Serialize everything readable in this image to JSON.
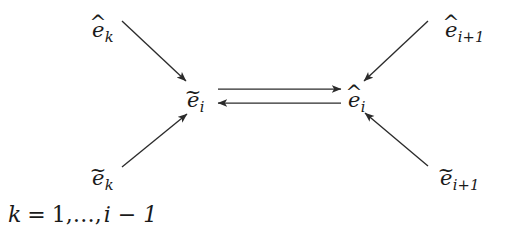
{
  "figure": {
    "type": "diagram",
    "background_color": "#ffffff",
    "stroke_color": "#2b2b2b",
    "text_color": "#1a1a1a"
  },
  "nodes": {
    "center_left": {
      "id": "e-tilde-i",
      "base": "e",
      "accent": "~",
      "subscript": "i",
      "text": "ẽi",
      "x": 193,
      "y": 95
    },
    "center_right": {
      "id": "e-hat-i",
      "base": "e",
      "accent": "^",
      "subscript": "i",
      "text": "êi",
      "x": 355,
      "y": 95
    }
  },
  "peripheral": {
    "top_left": {
      "id": "e-hat-k",
      "base": "e",
      "accent": "^",
      "subscript": "k",
      "text": "êk",
      "x": 92,
      "y": 20
    },
    "bottom_left": {
      "id": "e-tilde-k",
      "base": "e",
      "accent": "~",
      "subscript": "k",
      "text": "ẽk",
      "x": 92,
      "y": 168
    },
    "top_right": {
      "id": "e-hat-i-plus-1",
      "base": "e",
      "accent": "^",
      "subscript": "i+1",
      "text": "êi+1",
      "x": 445,
      "y": 20
    },
    "bottom_right": {
      "id": "e-tilde-i-plus-1",
      "base": "e",
      "accent": "~",
      "subscript": "i+1",
      "text": "ẽi+1",
      "x": 440,
      "y": 168
    }
  },
  "edges": [
    {
      "id": "arrow-hat-k-to-tilde-i",
      "from": "e-hat-k",
      "to": "e-tilde-i",
      "direction": "down-right",
      "x1": 122,
      "y1": 21,
      "x2": 186,
      "y2": 81
    },
    {
      "id": "arrow-tilde-k-to-tilde-i",
      "from": "e-tilde-k",
      "to": "e-tilde-i",
      "direction": "up-right",
      "x1": 122,
      "y1": 167,
      "x2": 187,
      "y2": 114
    },
    {
      "id": "arrow-hat-i1-to-hat-i",
      "from": "e-hat-i-plus-1",
      "to": "e-hat-i",
      "direction": "down-left",
      "x1": 428,
      "y1": 21,
      "x2": 364,
      "y2": 81
    },
    {
      "id": "arrow-tilde-i1-to-hat-i",
      "from": "e-tilde-i-plus-1",
      "to": "e-hat-i",
      "direction": "up-left",
      "x1": 428,
      "y1": 166,
      "x2": 365,
      "y2": 113
    },
    {
      "id": "arrow-tilde-i-to-hat-i",
      "from": "e-tilde-i",
      "to": "e-hat-i",
      "direction": "right",
      "x1": 218,
      "y1": 89,
      "x2": 340,
      "y2": 89
    },
    {
      "id": "arrow-hat-i-to-tilde-i",
      "from": "e-hat-i",
      "to": "e-tilde-i",
      "direction": "left",
      "x1": 340,
      "y1": 103,
      "x2": 218,
      "y2": 103
    }
  ],
  "condition": {
    "id": "index-range",
    "variable": "k",
    "equals": "=",
    "start": "1",
    "ellipsis": ",…,",
    "end_expression": "i − 1",
    "full_text": "k = 1,…, i − 1",
    "x": 8,
    "y": 206
  }
}
